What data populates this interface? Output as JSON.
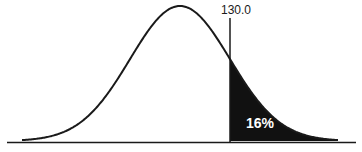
{
  "chart_data": {
    "type": "area",
    "title": "",
    "cutoff_value": "130.0",
    "shaded_region": "right tail",
    "shaded_percent": "16%",
    "xlabel": "",
    "ylabel": "",
    "grid": false
  },
  "labels": {
    "cutoff": "130.0",
    "area": "16%"
  },
  "colors": {
    "curve": "#1a1a1a",
    "shade": "#111111",
    "background": "#ffffff"
  }
}
